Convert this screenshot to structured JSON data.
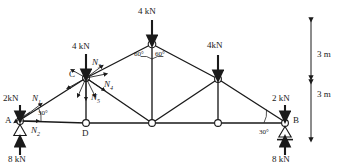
{
  "figure": {
    "type": "statics-truss-free-body-diagram",
    "stroke_color": "#1a1a1a",
    "node_fill": "#ffffff"
  },
  "nodes": [
    {
      "id": "A",
      "label": "A",
      "x": 20,
      "y": 121,
      "label_x": 5,
      "label_y": 116,
      "support": "pin-triangle"
    },
    {
      "id": "D",
      "label": "D",
      "x": 86,
      "y": 123,
      "label_x": 82,
      "label_y": 129,
      "support": "none"
    },
    {
      "id": "E",
      "label": "",
      "x": 152,
      "y": 123,
      "label_x": 0,
      "label_y": 0,
      "support": "none"
    },
    {
      "id": "F",
      "label": "",
      "x": 218,
      "y": 123,
      "label_x": 0,
      "label_y": 0,
      "support": "none"
    },
    {
      "id": "B",
      "label": "B",
      "x": 285,
      "y": 123,
      "label_x": 293,
      "label_y": 116,
      "support": "roller-triangle"
    },
    {
      "id": "C",
      "label": "C",
      "x": 86,
      "y": 78,
      "label_x": 69,
      "label_y": 70,
      "support": "none"
    },
    {
      "id": "TOP",
      "label": "",
      "x": 152,
      "y": 44,
      "label_x": 0,
      "label_y": 0,
      "support": "none"
    },
    {
      "id": "G",
      "label": "",
      "x": 218,
      "y": 79,
      "label_x": 0,
      "label_y": 0,
      "support": "none"
    }
  ],
  "members": [
    {
      "from": "A",
      "to": "D"
    },
    {
      "from": "D",
      "to": "E"
    },
    {
      "from": "E",
      "to": "F"
    },
    {
      "from": "F",
      "to": "B"
    },
    {
      "from": "A",
      "to": "C"
    },
    {
      "from": "C",
      "to": "TOP"
    },
    {
      "from": "TOP",
      "to": "G"
    },
    {
      "from": "G",
      "to": "B"
    },
    {
      "from": "C",
      "to": "D"
    },
    {
      "from": "C",
      "to": "E"
    },
    {
      "from": "TOP",
      "to": "E"
    },
    {
      "from": "E",
      "to": "G"
    },
    {
      "from": "G",
      "to": "F"
    }
  ],
  "loads": [
    {
      "name": "apex-load",
      "text": "4 kN",
      "arrow_x": 152,
      "arrow_top": 20,
      "arrow_bottom": 42,
      "label_x": 138,
      "label_y": 7,
      "direction": "down"
    },
    {
      "name": "joint-c-load",
      "text": "4 kN",
      "arrow_x": 86,
      "arrow_top": 54,
      "arrow_bottom": 76,
      "label_x": 72,
      "label_y": 42,
      "direction": "down"
    },
    {
      "name": "joint-g-load",
      "text": "4kN",
      "arrow_x": 218,
      "arrow_top": 55,
      "arrow_bottom": 77,
      "label_x": 207,
      "label_y": 41,
      "direction": "down"
    },
    {
      "name": "left-applied-load",
      "text": "2kN",
      "arrow_x": 20,
      "arrow_top": 105,
      "arrow_bottom": 118,
      "label_x": 3,
      "label_y": 94,
      "direction": "down"
    },
    {
      "name": "right-applied-load",
      "text": "2 kN",
      "arrow_x": 285,
      "arrow_top": 105,
      "arrow_bottom": 118,
      "label_x": 272,
      "label_y": 94,
      "direction": "down"
    },
    {
      "name": "left-reaction",
      "text": "8 kN",
      "arrow_x": 20,
      "arrow_top": 140,
      "arrow_bottom": 154,
      "label_x": 8,
      "label_y": 155,
      "direction": "up"
    },
    {
      "name": "right-reaction",
      "text": "8 kN",
      "arrow_x": 285,
      "arrow_top": 140,
      "arrow_bottom": 154,
      "label_x": 272,
      "label_y": 155,
      "direction": "up"
    }
  ],
  "force_labels": [
    {
      "name": "member-force-n1",
      "base": "N",
      "sub": "1",
      "x": 32,
      "y": 94
    },
    {
      "name": "member-force-n2",
      "base": "N",
      "sub": "2",
      "x": 31,
      "y": 126
    },
    {
      "name": "member-force-n3",
      "base": "N",
      "sub": "3",
      "x": 92,
      "y": 58
    },
    {
      "name": "member-force-n4",
      "base": "N",
      "sub": "4",
      "x": 104,
      "y": 80
    },
    {
      "name": "member-force-n5",
      "base": "N",
      "sub": "5",
      "x": 91,
      "y": 93
    }
  ],
  "angles": [
    {
      "name": "angle-apex-left",
      "text": "60",
      "x": 134,
      "y": 51
    },
    {
      "name": "angle-apex-right",
      "text": "60",
      "x": 155,
      "y": 51
    },
    {
      "name": "angle-support-a",
      "text": "30",
      "x": 38,
      "y": 110
    },
    {
      "name": "angle-support-b",
      "text": "30",
      "x": 259,
      "y": 129
    }
  ],
  "dimensions": [
    {
      "name": "dimension-upper",
      "text": "3 m",
      "x": 317,
      "y": 55,
      "top": 20,
      "bottom": 78
    },
    {
      "name": "dimension-lower",
      "text": "3 m",
      "x": 317,
      "y": 95,
      "top": 82,
      "bottom": 140
    }
  ]
}
